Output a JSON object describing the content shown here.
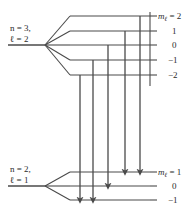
{
  "figure": {
    "kind": "zeeman-splitting-energy-level-diagram",
    "width": 192,
    "height": 216,
    "line_color": "#4a4a4a",
    "text_color": "#2b2b2b",
    "background": "#ffffff"
  },
  "upper_state": {
    "line1": "n = 3,",
    "line2": "ℓ = 2",
    "n_symbol": "n",
    "n_value": "3",
    "l_symbol": "ℓ",
    "l_value": "2",
    "fan_x": 45,
    "fan_y": 45,
    "baseline_x0": 8,
    "levels": [
      {
        "m": "2",
        "label_prefix": "m",
        "label_sub": "ℓ",
        "label_text": "= 2",
        "y": 16
      },
      {
        "m": "1",
        "label_prefix": "",
        "label_sub": "",
        "label_text": "1",
        "y": 31
      },
      {
        "m": "0",
        "label_prefix": "",
        "label_sub": "",
        "label_text": "0",
        "y": 45
      },
      {
        "m": "-1",
        "label_prefix": "",
        "label_sub": "",
        "label_text": "−1",
        "y": 60
      },
      {
        "m": "-2",
        "label_prefix": "",
        "label_sub": "",
        "label_text": "−2",
        "y": 75
      }
    ]
  },
  "lower_state": {
    "line1": "n = 2,",
    "line2": "ℓ = 1",
    "n_symbol": "n",
    "n_value": "2",
    "l_symbol": "ℓ",
    "l_value": "1",
    "fan_x": 45,
    "fan_y": 186,
    "baseline_x0": 8,
    "levels": [
      {
        "m": "1",
        "label_prefix": "m",
        "label_sub": "ℓ",
        "label_text": "= 1",
        "y": 172
      },
      {
        "m": "0",
        "label_prefix": "",
        "label_sub": "",
        "label_text": "0",
        "y": 186
      },
      {
        "m": "-1",
        "label_prefix": "",
        "label_sub": "",
        "label_text": "−1",
        "y": 200
      }
    ]
  },
  "geometry": {
    "level_left_x": 57,
    "level_right_x": 150,
    "axis_x": 150,
    "tick_len": 7,
    "fan_break_x": 70
  },
  "transitions": [
    {
      "id": "t1",
      "x": 80,
      "from_m": "-2",
      "to_m": "-1",
      "y_start": 75,
      "y_end": 200
    },
    {
      "id": "t2",
      "x": 93,
      "from_m": "-1",
      "to_m": "-1",
      "y_start": 60,
      "y_end": 200
    },
    {
      "id": "t3",
      "x": 108,
      "from_m": "0",
      "to_m": "0",
      "y_start": 45,
      "y_end": 186
    },
    {
      "id": "t4",
      "x": 125,
      "from_m": "1",
      "to_m": "1",
      "y_start": 31,
      "y_end": 172
    },
    {
      "id": "t5",
      "x": 140,
      "from_m": "2",
      "to_m": "1",
      "y_start": 16,
      "y_end": 172
    }
  ]
}
